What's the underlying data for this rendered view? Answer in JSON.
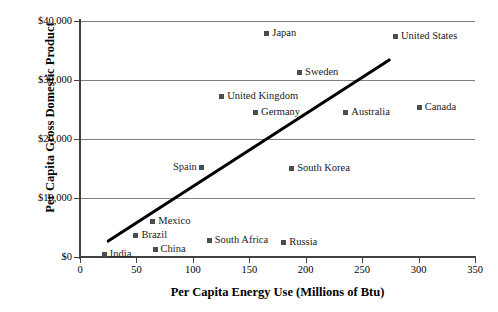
{
  "chart_data": {
    "type": "scatter",
    "title": "",
    "xlabel": "Per Capita Energy Use (Millions of Btu)",
    "ylabel": "Per Capita Gross Domestic Product",
    "xlim": [
      0,
      350
    ],
    "ylim": [
      0,
      40000
    ],
    "xticks": [
      "0",
      "50",
      "100",
      "150",
      "200",
      "250",
      "300",
      "350"
    ],
    "xtick_values": [
      0,
      50,
      100,
      150,
      200,
      250,
      300,
      350
    ],
    "yticks": [
      "$0",
      "$10,000",
      "$20,000",
      "$30,000",
      "$40,000"
    ],
    "ytick_values": [
      0,
      10000,
      20000,
      30000,
      40000
    ],
    "grid": "horizontal",
    "legend": "none",
    "marker_color": "#4d4d4d",
    "gridline_color": "#808080",
    "axis_color": "#404040",
    "trendline_color": "#000000",
    "points": [
      {
        "label": "Japan",
        "x": 166,
        "y": 37800,
        "label_side": "right"
      },
      {
        "label": "United States",
        "x": 280,
        "y": 37300,
        "label_side": "right"
      },
      {
        "label": "Sweden",
        "x": 195,
        "y": 31200,
        "label_side": "right"
      },
      {
        "label": "United Kingdom",
        "x": 126,
        "y": 27100,
        "label_side": "right"
      },
      {
        "label": "Germany",
        "x": 156,
        "y": 24400,
        "label_side": "right"
      },
      {
        "label": "Australia",
        "x": 236,
        "y": 24400,
        "label_side": "right"
      },
      {
        "label": "Canada",
        "x": 301,
        "y": 25300,
        "label_side": "right"
      },
      {
        "label": "Spain",
        "x": 108,
        "y": 15100,
        "label_side": "left"
      },
      {
        "label": "South Korea",
        "x": 188,
        "y": 14900,
        "label_side": "right"
      },
      {
        "label": "Mexico",
        "x": 65,
        "y": 5900,
        "label_side": "right"
      },
      {
        "label": "Brazil",
        "x": 50,
        "y": 3500,
        "label_side": "right"
      },
      {
        "label": "China",
        "x": 67,
        "y": 1200,
        "label_side": "right"
      },
      {
        "label": "South Africa",
        "x": 115,
        "y": 2700,
        "label_side": "right"
      },
      {
        "label": "Russia",
        "x": 181,
        "y": 2400,
        "label_side": "right"
      },
      {
        "label": "India",
        "x": 22,
        "y": 400,
        "label_side": "right"
      }
    ],
    "trendline": {
      "name": "linear trend",
      "x_start": 25,
      "y_start": 2700,
      "x_end": 274,
      "y_end": 33400
    }
  }
}
